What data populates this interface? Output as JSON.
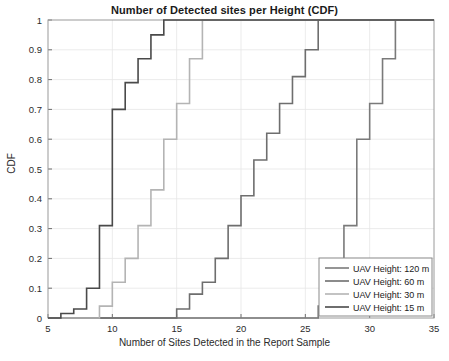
{
  "chart_data": {
    "type": "line",
    "title": "Number of Detected sites per Height (CDF)",
    "xlabel": "Number of Sites Detected in the Report Sample",
    "ylabel": "CDF",
    "xlim": [
      5,
      35
    ],
    "ylim": [
      0,
      1
    ],
    "xticks": [
      5,
      10,
      15,
      20,
      25,
      30,
      35
    ],
    "xtick_labels": [
      "5",
      "10",
      "15",
      "20",
      "25",
      "30",
      "35"
    ],
    "yticks": [
      0,
      0.1,
      0.2,
      0.3,
      0.4,
      0.5,
      0.6,
      0.7,
      0.8,
      0.9,
      1
    ],
    "ytick_labels": [
      "0",
      "0.1",
      "0.2",
      "0.3",
      "0.4",
      "0.5",
      "0.6",
      "0.7",
      "0.8",
      "0.9",
      "1"
    ],
    "grid": true,
    "legend_position": "lower right",
    "series": [
      {
        "name": "UAV Height: 120 m",
        "color": "#7a7a7a",
        "x": [
          26,
          27,
          28,
          29,
          30,
          31,
          32,
          35
        ],
        "y": [
          0.04,
          0.12,
          0.31,
          0.6,
          0.72,
          0.87,
          1.0,
          1.0
        ]
      },
      {
        "name": "UAV Height: 60 m",
        "color": "#6e6e6e",
        "x": [
          15,
          16,
          17,
          18,
          19,
          20,
          21,
          22,
          23,
          24,
          25,
          26,
          35
        ],
        "y": [
          0.03,
          0.08,
          0.12,
          0.2,
          0.31,
          0.41,
          0.53,
          0.62,
          0.72,
          0.81,
          0.9,
          1.0,
          1.0
        ]
      },
      {
        "name": "UAV Height: 30 m",
        "color": "#b4b4b4",
        "x": [
          9,
          10,
          11,
          12,
          13,
          14,
          15,
          16,
          17,
          35
        ],
        "y": [
          0.04,
          0.12,
          0.2,
          0.31,
          0.43,
          0.6,
          0.72,
          0.87,
          1.0,
          1.0
        ]
      },
      {
        "name": "UAV Height: 15 m",
        "color": "#4a4a4a",
        "x": [
          6,
          7,
          8,
          9,
          10,
          11,
          12,
          13,
          14,
          35
        ],
        "y": [
          0.015,
          0.03,
          0.1,
          0.31,
          0.7,
          0.79,
          0.87,
          0.95,
          1.0,
          1.0
        ]
      }
    ]
  },
  "legend": {
    "entries": [
      {
        "label": "UAV Height: 120 m"
      },
      {
        "label": "UAV Height: 60 m"
      },
      {
        "label": "UAV Height: 30 m"
      },
      {
        "label": "UAV Height: 15 m"
      }
    ]
  }
}
